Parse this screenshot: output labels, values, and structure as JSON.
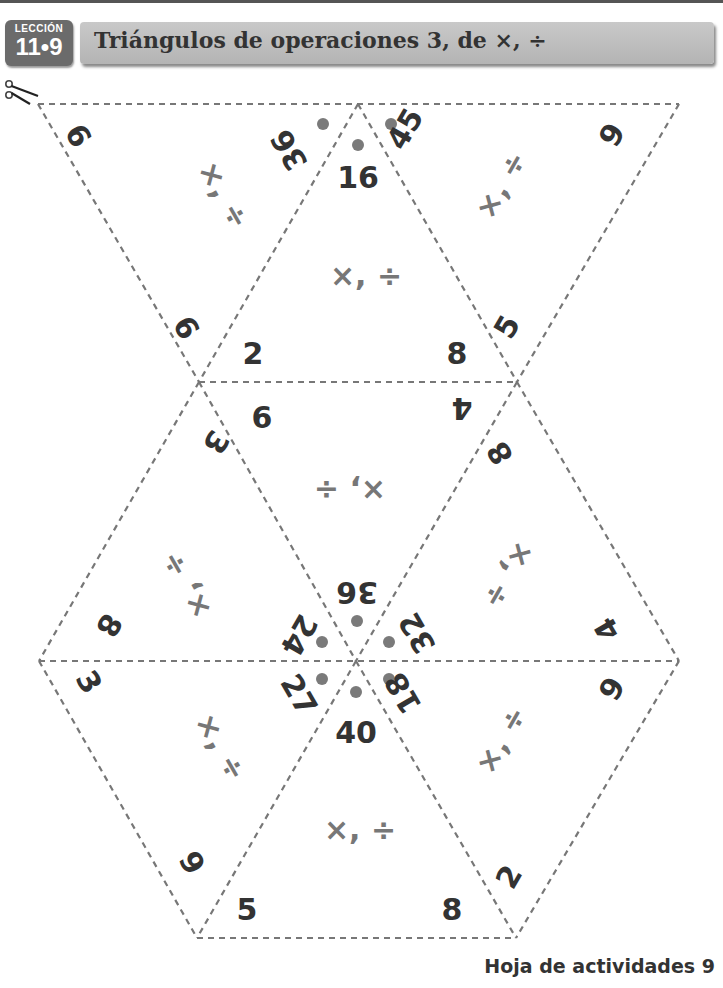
{
  "header": {
    "lesson_label": "LECCIÓN",
    "lesson_number": "11•9",
    "title": "Triángulos de operaciones 3, de ×, ÷"
  },
  "icons": {
    "scissors": "scissors-icon"
  },
  "colors": {
    "title_bar": "#bdbdbd",
    "badge": "#6b6b6b",
    "dashed_line": "#777777",
    "dot": "#7a7a7a",
    "number": "#333333",
    "operations": "#777777"
  },
  "triangles": [
    {
      "position": "top-left",
      "operations": "×, ÷",
      "top_product": "36",
      "corners": [
        "9",
        "9"
      ]
    },
    {
      "position": "top-center",
      "operations": "×, ÷",
      "top_product": "16",
      "corners": [
        "2",
        "8"
      ]
    },
    {
      "position": "top-right",
      "operations": "×, ÷",
      "top_product": "45",
      "corners": [
        "9",
        "5"
      ]
    },
    {
      "position": "middle-left",
      "operations": "×, ÷",
      "top_product": "24",
      "corners": [
        "3",
        "8"
      ]
    },
    {
      "position": "middle-center",
      "operations": "×, ÷",
      "top_product": "36",
      "corners": [
        "6",
        "4"
      ]
    },
    {
      "position": "middle-right",
      "operations": "×, ÷",
      "top_product": "32",
      "corners": [
        "8",
        "4"
      ]
    },
    {
      "position": "bottom-left",
      "operations": "×, ÷",
      "top_product": "27",
      "corners": [
        "3",
        "9"
      ]
    },
    {
      "position": "bottom-center",
      "operations": "×, ÷",
      "top_product": "40",
      "corners": [
        "5",
        "8"
      ]
    },
    {
      "position": "bottom-right",
      "operations": "×, ÷",
      "top_product": "18",
      "corners": [
        "9",
        "2"
      ]
    }
  ],
  "footer": {
    "label": "Hoja de actividades 9"
  }
}
